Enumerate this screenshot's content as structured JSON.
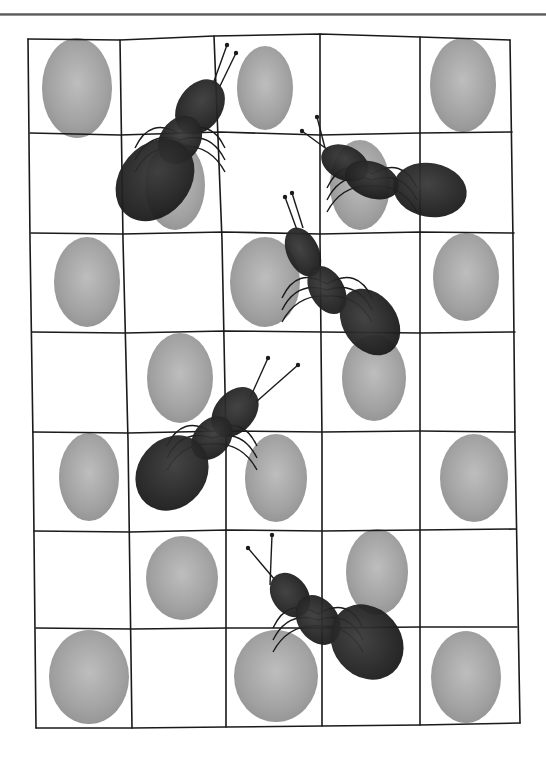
{
  "artwork": {
    "subject": "fingerprint ants on a hand-drawn grid",
    "style": "grayscale fingerprint illustration",
    "grid": {
      "columns": 5,
      "rows": 7
    },
    "colors": {
      "print": "#8f8f8f",
      "print_light": "#b3b3b3",
      "ant": "#2a2a2a",
      "line": "#1a1a1a",
      "rule": "#6e6e6e"
    },
    "fingerprints": [
      {
        "cx": 77,
        "cy": 88,
        "rx": 35,
        "ry": 50
      },
      {
        "cx": 265,
        "cy": 88,
        "rx": 28,
        "ry": 42
      },
      {
        "cx": 463,
        "cy": 85,
        "rx": 33,
        "ry": 47
      },
      {
        "cx": 175,
        "cy": 185,
        "rx": 30,
        "ry": 45
      },
      {
        "cx": 360,
        "cy": 185,
        "rx": 30,
        "ry": 45
      },
      {
        "cx": 87,
        "cy": 282,
        "rx": 33,
        "ry": 45
      },
      {
        "cx": 265,
        "cy": 282,
        "rx": 35,
        "ry": 45
      },
      {
        "cx": 466,
        "cy": 277,
        "rx": 33,
        "ry": 44
      },
      {
        "cx": 180,
        "cy": 378,
        "rx": 33,
        "ry": 45
      },
      {
        "cx": 374,
        "cy": 378,
        "rx": 32,
        "ry": 43
      },
      {
        "cx": 89,
        "cy": 477,
        "rx": 30,
        "ry": 44
      },
      {
        "cx": 276,
        "cy": 478,
        "rx": 31,
        "ry": 44
      },
      {
        "cx": 474,
        "cy": 478,
        "rx": 34,
        "ry": 44
      },
      {
        "cx": 182,
        "cy": 578,
        "rx": 36,
        "ry": 42
      },
      {
        "cx": 377,
        "cy": 572,
        "rx": 31,
        "ry": 43
      },
      {
        "cx": 89,
        "cy": 677,
        "rx": 40,
        "ry": 47
      },
      {
        "cx": 276,
        "cy": 676,
        "rx": 42,
        "ry": 46
      },
      {
        "cx": 466,
        "cy": 677,
        "rx": 35,
        "ry": 46
      }
    ],
    "ants": [
      {
        "name": "ant-1",
        "parts": [
          {
            "cx": 200,
            "cy": 107,
            "rx": 22,
            "ry": 30,
            "rot": 35
          },
          {
            "cx": 180,
            "cy": 140,
            "rx": 20,
            "ry": 26,
            "rot": 35
          },
          {
            "cx": 155,
            "cy": 180,
            "rx": 35,
            "ry": 45,
            "rot": 40
          }
        ],
        "antennae": [
          [
            213,
            84,
            227,
            45
          ],
          [
            220,
            86,
            236,
            53
          ]
        ]
      },
      {
        "name": "ant-2",
        "parts": [
          {
            "cx": 345,
            "cy": 163,
            "rx": 25,
            "ry": 17,
            "rot": 25
          },
          {
            "cx": 372,
            "cy": 180,
            "rx": 28,
            "ry": 18,
            "rot": 20
          },
          {
            "cx": 430,
            "cy": 190,
            "rx": 37,
            "ry": 27,
            "rot": 10
          }
        ],
        "antennae": [
          [
            328,
            150,
            302,
            131
          ],
          [
            325,
            148,
            317,
            117
          ]
        ]
      },
      {
        "name": "ant-3",
        "parts": [
          {
            "cx": 303,
            "cy": 252,
            "rx": 16,
            "ry": 26,
            "rot": -25
          },
          {
            "cx": 327,
            "cy": 290,
            "rx": 17,
            "ry": 26,
            "rot": -30
          },
          {
            "cx": 370,
            "cy": 322,
            "rx": 27,
            "ry": 36,
            "rot": -35
          }
        ],
        "antennae": [
          [
            297,
            230,
            285,
            197
          ],
          [
            303,
            228,
            292,
            193
          ]
        ]
      },
      {
        "name": "ant-4",
        "parts": [
          {
            "cx": 235,
            "cy": 412,
            "rx": 20,
            "ry": 28,
            "rot": 40
          },
          {
            "cx": 212,
            "cy": 438,
            "rx": 18,
            "ry": 24,
            "rot": 40
          },
          {
            "cx": 172,
            "cy": 473,
            "rx": 34,
            "ry": 40,
            "rot": 40
          }
        ],
        "antennae": [
          [
            250,
            398,
            268,
            358
          ],
          [
            256,
            402,
            298,
            365
          ]
        ]
      },
      {
        "name": "ant-5",
        "parts": [
          {
            "cx": 290,
            "cy": 595,
            "rx": 18,
            "ry": 24,
            "rot": -35
          },
          {
            "cx": 318,
            "cy": 620,
            "rx": 20,
            "ry": 27,
            "rot": -35
          },
          {
            "cx": 367,
            "cy": 642,
            "rx": 34,
            "ry": 40,
            "rot": -40
          }
        ],
        "antennae": [
          [
            275,
            580,
            248,
            548
          ],
          [
            270,
            585,
            272,
            535
          ]
        ]
      }
    ]
  }
}
